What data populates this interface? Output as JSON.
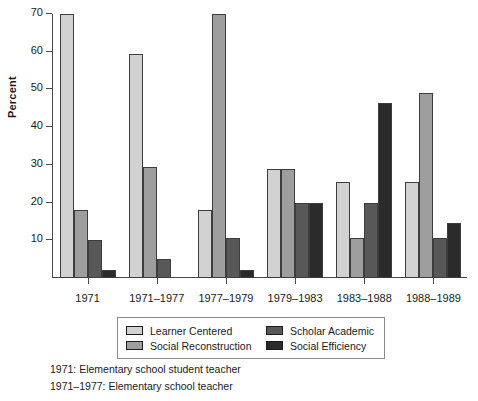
{
  "chart_data": {
    "type": "bar",
    "title": "",
    "xlabel": "",
    "ylabel": "Percent",
    "ylim": [
      0,
      70
    ],
    "yticks": [
      10,
      20,
      30,
      40,
      50,
      60,
      70
    ],
    "grid": false,
    "legend_position": "bottom",
    "categories": [
      "1971",
      "1971–1977",
      "1977–1979",
      "1979–1983",
      "1983–1988",
      "1988–1989"
    ],
    "series": [
      {
        "name": "Learner Centered",
        "color": "#d2d2d2",
        "values": [
          70,
          59.5,
          18,
          29,
          25.5,
          25.5
        ]
      },
      {
        "name": "Social Reconstruction",
        "color": "#9e9e9e",
        "values": [
          18,
          29.5,
          70,
          29,
          10.5,
          49
        ]
      },
      {
        "name": "Scholar Academic",
        "color": "#585858",
        "values": [
          10,
          5,
          10.5,
          20,
          20,
          10.5
        ]
      },
      {
        "name": "Social Efficiency",
        "color": "#2b2b2b",
        "values": [
          2,
          0,
          2,
          20,
          46.5,
          14.5
        ]
      }
    ],
    "annotations": [
      "1971: Elementary school student teacher",
      "1971–1977: Elementary school teacher"
    ]
  },
  "axis": {
    "y_title": "Percent"
  },
  "footnotes": [
    "1971: Elementary school student teacher",
    "1971–1977: Elementary school teacher"
  ]
}
